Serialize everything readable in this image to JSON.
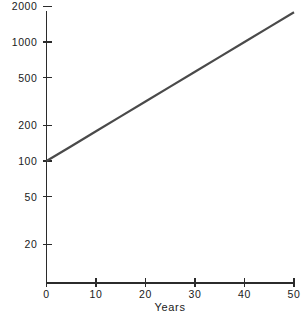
{
  "chart_data": {
    "type": "line",
    "title": "",
    "subtitle": "",
    "xlabel": "Years",
    "ylabel": "",
    "xlim": [
      0,
      50
    ],
    "ylim": [
      15,
      2000
    ],
    "yscale": "log",
    "xscale": "linear",
    "grid": false,
    "legend": null,
    "x_ticks": [
      {
        "value": 0,
        "label": "0"
      },
      {
        "value": 10,
        "label": "10"
      },
      {
        "value": 20,
        "label": "20"
      },
      {
        "value": 30,
        "label": "30"
      },
      {
        "value": 40,
        "label": "40"
      },
      {
        "value": 50,
        "label": "50"
      }
    ],
    "y_ticks": [
      {
        "value": 20,
        "label": "20"
      },
      {
        "value": 50,
        "label": "50"
      },
      {
        "value": 100,
        "label": "100"
      },
      {
        "value": 200,
        "label": "200"
      },
      {
        "value": 500,
        "label": "500"
      },
      {
        "value": 1000,
        "label": "1000"
      },
      {
        "value": 2000,
        "label": "2000"
      }
    ],
    "series": [
      {
        "name": "growth",
        "color": "#4a4a4a",
        "x": [
          0,
          5,
          10,
          15,
          20,
          25,
          30,
          35,
          40,
          45,
          50
        ],
        "values": [
          100,
          133,
          178,
          237,
          316,
          422,
          562,
          750,
          1000,
          1334,
          1778
        ]
      }
    ],
    "annotations": []
  },
  "axis_title": {
    "x_label": "Years"
  },
  "colors": {
    "line": "#4a4a4a",
    "axis": "#2b2b2b",
    "text": "#1a1a1a",
    "background": "#ffffff"
  }
}
